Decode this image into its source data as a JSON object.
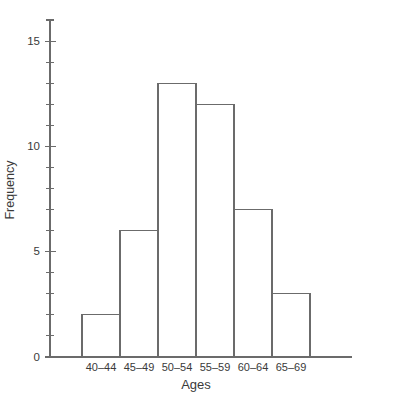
{
  "chart_data": {
    "type": "bar",
    "title": "",
    "xlabel": "Ages",
    "ylabel": "Frequency",
    "categories": [
      "40–44",
      "45–49",
      "50–54",
      "55–59",
      "60–64",
      "65–69"
    ],
    "values": [
      2,
      6,
      13,
      12,
      7,
      3
    ],
    "ylim": [
      0,
      16
    ],
    "major_ticks": [
      0,
      5,
      10,
      15
    ],
    "major_tick_labels": [
      "0",
      "5",
      "10",
      "15"
    ],
    "minor_tick_step": 1,
    "grid": false,
    "legend": null,
    "colors": {
      "bar_fill": "#ffffff",
      "bar_stroke": "#6b6b6b",
      "axis": "#6b6b6b",
      "text": "#3a3a3a",
      "background": "#ffffff"
    }
  },
  "axis": {
    "y_title": "Frequency",
    "x_title": "Ages"
  }
}
